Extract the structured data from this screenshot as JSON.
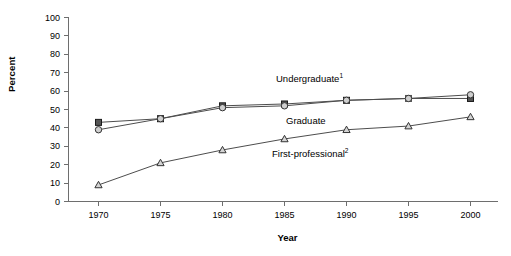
{
  "chart_data": {
    "type": "line",
    "title": "",
    "xlabel": "Year",
    "ylabel": "Percent",
    "x": [
      1970,
      1975,
      1980,
      1985,
      1990,
      1995,
      2000
    ],
    "categories": [
      "1970",
      "1975",
      "1980",
      "1985",
      "1990",
      "1995",
      "2000"
    ],
    "xlim": [
      1968,
      2002
    ],
    "ylim": [
      0,
      100
    ],
    "yticks": [
      "0",
      "10",
      "20",
      "30",
      "40",
      "50",
      "60",
      "70",
      "80",
      "90",
      "100"
    ],
    "ytick_values": [
      0,
      10,
      20,
      30,
      40,
      50,
      60,
      70,
      80,
      90,
      100
    ],
    "grid": false,
    "legend_position": "inline-annotations",
    "series": [
      {
        "name": "Undergraduate",
        "label": "Undergraduate",
        "superscript": "1",
        "marker": "square",
        "values": [
          43,
          45,
          52,
          53,
          55,
          56,
          56
        ]
      },
      {
        "name": "Graduate",
        "label": "Graduate",
        "superscript": "",
        "marker": "circle",
        "values": [
          39,
          45,
          51,
          52,
          55,
          56,
          58
        ]
      },
      {
        "name": "First-professional",
        "label": "First-professional",
        "superscript": "2",
        "marker": "triangle",
        "values": [
          9,
          21,
          28,
          34,
          39,
          41,
          46
        ]
      }
    ],
    "annotations": [
      {
        "text": "Undergraduate",
        "superscript": "1",
        "x": 276,
        "y": 82
      },
      {
        "text": "Graduate",
        "superscript": "",
        "x": 286,
        "y": 124
      },
      {
        "text": "First-professional",
        "superscript": "2",
        "x": 272,
        "y": 157
      }
    ],
    "colors": {
      "axis": "#6e6e6e",
      "line": "#4d4d4d",
      "marker_square_fill": "#555555",
      "marker_circle_fill": "#cfcfcf",
      "marker_triangle_fill": "#d4d4d4",
      "background": "#ffffff",
      "text": "#000000"
    }
  }
}
